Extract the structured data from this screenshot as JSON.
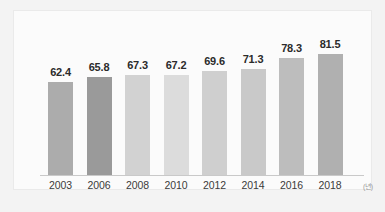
{
  "chart_data": {
    "type": "bar",
    "title": "",
    "xlabel": "",
    "ylabel": "",
    "unit_label": "(년)",
    "grid": false,
    "legend": "none",
    "ylim": [
      0,
      90
    ],
    "categories": [
      "2003",
      "2006",
      "2008",
      "2010",
      "2012",
      "2014",
      "2016",
      "2018"
    ],
    "values": [
      62.4,
      65.8,
      67.3,
      67.2,
      69.6,
      71.3,
      78.3,
      81.5
    ],
    "value_labels": [
      "62.4",
      "65.8",
      "67.3",
      "67.2",
      "69.6",
      "71.3",
      "78.3",
      "81.5"
    ],
    "bar_colors": [
      "#acacac",
      "#9a9a9a",
      "#d2d2d2",
      "#dcdcdc",
      "#cfcfcf",
      "#c9c9c9",
      "#bdbdbd",
      "#b0b0b0"
    ]
  },
  "colors": {
    "page_background": "#f3f3f3",
    "panel_background": "#fbfbfb",
    "axis_line": "#c9c9c9",
    "value_text": "#2b2b2b",
    "tick_text": "#3a3a3a",
    "unit_text": "#9a9a9a"
  }
}
